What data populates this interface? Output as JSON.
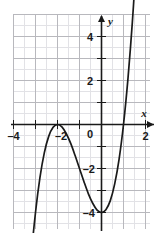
{
  "chart_data": {
    "type": "line",
    "title": "",
    "subtitle": "",
    "xlabel": "x",
    "ylabel": "y",
    "xlim": [
      -4.6,
      2.5
    ],
    "ylim": [
      -4.7,
      5.1
    ],
    "grid": true,
    "minor_grid_step": 0.5,
    "major_grid_step": 1,
    "legend": "none",
    "x_ticks": [
      -4,
      -2,
      2
    ],
    "x_tick_labels": [
      "–4",
      "–2",
      "2"
    ],
    "y_ticks": [
      4,
      2,
      -2,
      -4
    ],
    "y_tick_labels": [
      "4",
      "2",
      "–2",
      "–4"
    ],
    "origin_label": "0",
    "curve_expression": "y = x^3 + 3x^2 - 4",
    "features": {
      "local_maximum": [
        -2,
        0
      ],
      "local_minimum": [
        0,
        -4
      ],
      "x_intercepts": [
        -2,
        1
      ],
      "y_intercept": -4
    },
    "series": [
      {
        "name": "cubic",
        "color": "#1a1a1a",
        "x": [
          -3.55,
          -3.4,
          -3.2,
          -3.0,
          -2.8,
          -2.6,
          -2.4,
          -2.2,
          -2.0,
          -1.8,
          -1.6,
          -1.4,
          -1.2,
          -1.0,
          -0.8,
          -0.6,
          -0.4,
          -0.2,
          0.0,
          0.2,
          0.4,
          0.6,
          0.8,
          1.0,
          1.2,
          1.4,
          1.55
        ],
        "y": [
          -10.93,
          -8.74,
          -6.05,
          -4.0,
          -2.43,
          -1.29,
          -0.54,
          -0.13,
          0.0,
          -0.11,
          -0.42,
          -0.86,
          -1.41,
          -2.0,
          -2.59,
          -3.14,
          -3.58,
          -3.89,
          -4.0,
          -3.87,
          -3.46,
          -2.7,
          -1.57,
          0.0,
          2.05,
          4.62,
          6.94
        ]
      }
    ]
  },
  "axes": {
    "y_axis_name": "y",
    "x_axis_name": "x"
  }
}
